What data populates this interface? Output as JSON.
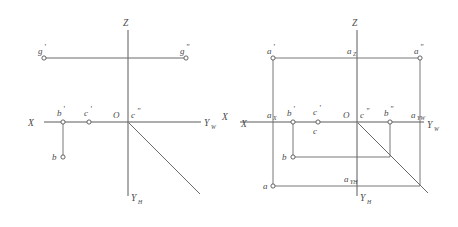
{
  "drawing": {
    "title": "Orthographic projection point diagrams",
    "background_color": "#ffffff",
    "line_color": "#5a5a5a",
    "text_color": "#4a4a4a",
    "width": 458,
    "height": 227
  },
  "left_diagram": {
    "name": "Projection diagram with line g and points b, c",
    "axes": [
      {
        "key": "z",
        "label": "Z"
      },
      {
        "key": "x",
        "label": "X"
      },
      {
        "key": "yw",
        "label": "Y",
        "sub": "W"
      },
      {
        "key": "yh",
        "label": "Y",
        "sub": "H"
      }
    ],
    "points": [
      {
        "key": "g_prime",
        "label": "g",
        "prime": "'"
      },
      {
        "key": "g_double",
        "label": "g",
        "prime": "\""
      },
      {
        "key": "b_prime",
        "label": "b",
        "prime": "'"
      },
      {
        "key": "c_prime",
        "label": "c",
        "prime": "'"
      },
      {
        "key": "origin",
        "label": "O",
        "prime": ""
      },
      {
        "key": "c_double",
        "label": "c",
        "prime": "\""
      },
      {
        "key": "b",
        "label": "b",
        "prime": ""
      }
    ]
  },
  "right_diagram": {
    "name": "Projection diagram with point a box and points b, c",
    "axes": [
      {
        "key": "z",
        "label": "Z"
      },
      {
        "key": "x",
        "label": "X"
      },
      {
        "key": "yw",
        "label": "Y",
        "sub": "W"
      },
      {
        "key": "yh",
        "label": "Y",
        "sub": "H"
      }
    ],
    "points": [
      {
        "key": "a_prime",
        "label": "a",
        "prime": "'"
      },
      {
        "key": "a_z",
        "label": "a",
        "sub": "Z"
      },
      {
        "key": "a_double",
        "label": "a",
        "prime": "\""
      },
      {
        "key": "a_x",
        "label": "a",
        "sub": "X"
      },
      {
        "key": "b_prime",
        "label": "b",
        "prime": "'"
      },
      {
        "key": "c_prime",
        "label": "c",
        "prime": "'"
      },
      {
        "key": "c",
        "label": "c",
        "prime": ""
      },
      {
        "key": "origin",
        "label": "O",
        "prime": ""
      },
      {
        "key": "c_double",
        "label": "c",
        "prime": "\""
      },
      {
        "key": "b_double",
        "label": "b",
        "prime": "\""
      },
      {
        "key": "a_yw",
        "label": "a",
        "sub": "YW"
      },
      {
        "key": "b",
        "label": "b",
        "prime": ""
      },
      {
        "key": "a_yh",
        "label": "a",
        "sub": "YH"
      },
      {
        "key": "a",
        "label": "a",
        "prime": ""
      }
    ]
  }
}
